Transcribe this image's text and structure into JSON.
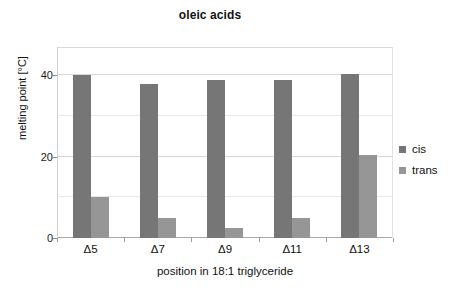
{
  "chart_data": {
    "type": "bar",
    "title": "oleic acids",
    "xlabel": "position in 18:1 triglyceride",
    "ylabel": "melting point [°C]",
    "categories": [
      "Δ5",
      "Δ7",
      "Δ9",
      "Δ11",
      "Δ13"
    ],
    "series": [
      {
        "name": "cis",
        "color": "#767676",
        "values": [
          40,
          38,
          39,
          39,
          40.3
        ]
      },
      {
        "name": "trans",
        "color": "#969696",
        "values": [
          10,
          5,
          2.5,
          5,
          20.5
        ]
      }
    ],
    "ylim": [
      0,
      47
    ],
    "yticks": [
      0,
      20,
      40
    ],
    "yticklabels": [
      "0",
      "20",
      "40"
    ],
    "yminorticks": [
      10,
      30
    ],
    "grid": true,
    "legend_position": "right",
    "bar_fill_cis": "#767676",
    "bar_fill_trans": "#969696",
    "gridline_color": "#d7d7d7",
    "axis_color": "#a8a8a8",
    "background": "#ffffff"
  },
  "legend": {
    "items": [
      {
        "label": "cis",
        "color": "#767676"
      },
      {
        "label": "trans",
        "color": "#969696"
      }
    ]
  }
}
